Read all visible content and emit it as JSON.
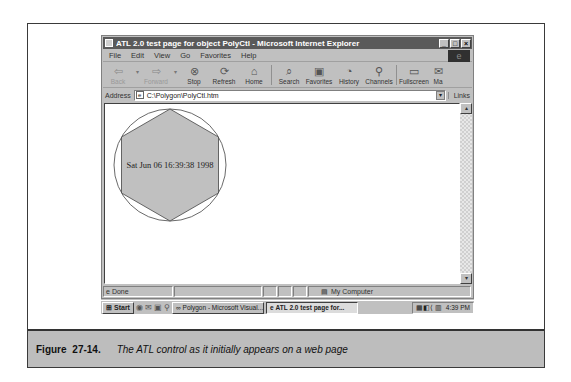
{
  "browser": {
    "title": "ATL 2.0 test page for object PolyCtl - Microsoft Internet Explorer",
    "window_buttons": [
      "_",
      "□",
      "×"
    ],
    "menu": [
      "File",
      "Edit",
      "View",
      "Go",
      "Favorites",
      "Help"
    ],
    "toolbar": [
      {
        "label": "Back",
        "icon": "back-arrow-icon",
        "glyph": "⇦",
        "disabled": true
      },
      {
        "label": "Forward",
        "icon": "forward-arrow-icon",
        "glyph": "⇨",
        "disabled": true
      },
      {
        "label": "Stop",
        "icon": "stop-icon",
        "glyph": "⊗"
      },
      {
        "label": "Refresh",
        "icon": "refresh-icon",
        "glyph": "⟳"
      },
      {
        "label": "Home",
        "icon": "home-icon",
        "glyph": "⌂"
      },
      {
        "label": "Search",
        "icon": "search-icon",
        "glyph": "⌕"
      },
      {
        "label": "Favorites",
        "icon": "favorites-icon",
        "glyph": "▣"
      },
      {
        "label": "History",
        "icon": "history-icon",
        "glyph": "◔"
      },
      {
        "label": "Channels",
        "icon": "channels-icon",
        "glyph": "⚲"
      },
      {
        "label": "Fullscreen",
        "icon": "fullscreen-icon",
        "glyph": "▭"
      },
      {
        "label": "Ma",
        "icon": "mail-icon",
        "glyph": "✉"
      }
    ],
    "address_label": "Address",
    "address_value": "C:\\Polygon\\PolyCtl.htm",
    "links_label": "Links",
    "status_text": "Done",
    "zone_text": "My Computer"
  },
  "control": {
    "date_text": "Sat Jun 06 16:39:38 1998",
    "fill_color": "#c0c0c0",
    "sides": 6
  },
  "taskbar": {
    "start_label": "Start",
    "tasks": [
      {
        "label": "Polygon - Microsoft Visual...",
        "active": false
      },
      {
        "label": "ATL 2.0 test page for...",
        "active": true
      }
    ],
    "clock": "4:39 PM"
  },
  "caption": {
    "figure_number": "Figure 27-14.",
    "text": "The ATL control as it initially appears on a web page"
  }
}
